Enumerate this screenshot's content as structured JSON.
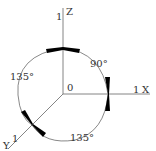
{
  "diagram": {
    "axes": {
      "z": {
        "name": "Z",
        "unit_label": "1"
      },
      "x": {
        "name": "X",
        "unit_label": "1"
      },
      "y": {
        "name": "Y",
        "unit_label": "1"
      },
      "origin_label": "0"
    },
    "angles": {
      "z_to_x": "90°",
      "z_to_y": "135°",
      "y_to_x": "135°"
    },
    "colors": {
      "line": "#555555",
      "arrow": "#000000"
    }
  }
}
